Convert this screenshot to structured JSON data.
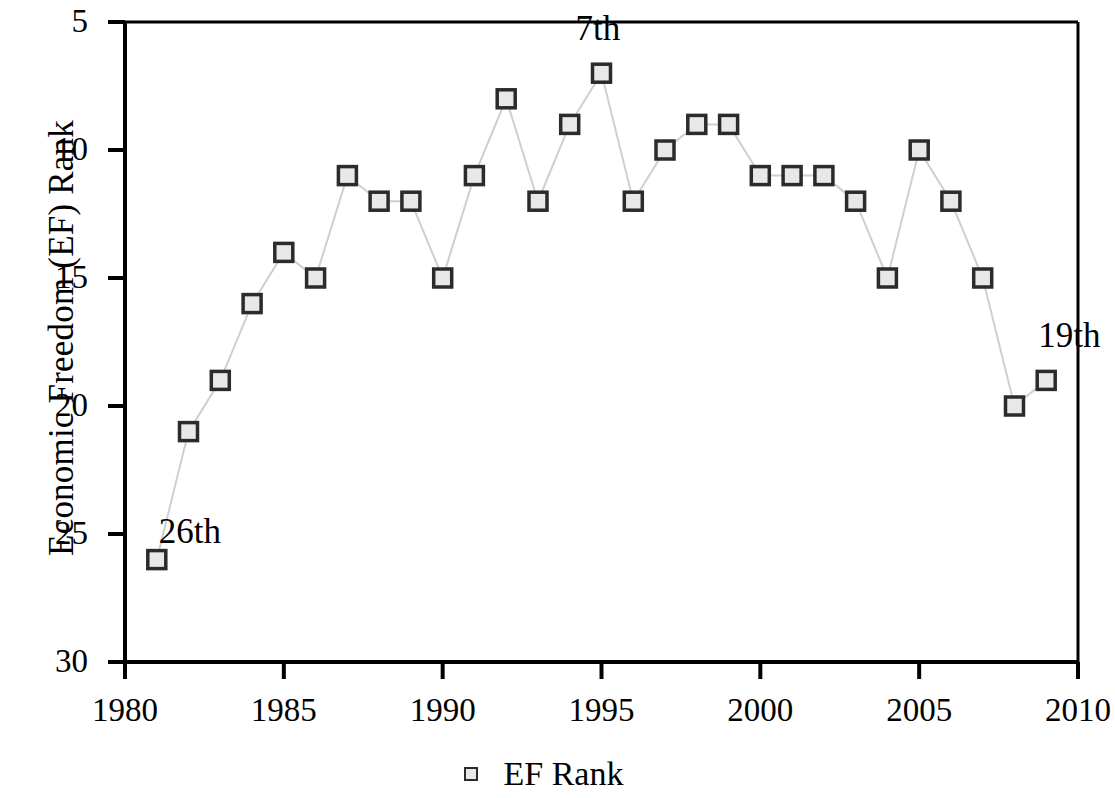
{
  "chart_data": {
    "type": "line",
    "title": "",
    "subtitle": "",
    "xlabel": "",
    "ylabel": "Economic Freedom (EF) Rank",
    "xlim": [
      1980,
      2010
    ],
    "ylim": [
      5,
      30
    ],
    "y_inverted": true,
    "grid": false,
    "legend_position": "bottom-center",
    "xticks": [
      1980,
      1985,
      1990,
      1995,
      2000,
      2005,
      2010
    ],
    "xtick_labels": [
      "1980",
      "1985",
      "1990",
      "1995",
      "2000",
      "2005",
      "2010"
    ],
    "yticks": [
      5,
      10,
      15,
      20,
      25,
      30
    ],
    "ytick_labels": [
      "5",
      "10",
      "15",
      "20",
      "25",
      "30"
    ],
    "series": [
      {
        "name": "EF Rank",
        "marker": "open-square",
        "marker_fill": "#e8e8e8",
        "marker_edge": "#2b2b2b",
        "line_color": "#cfcfcf",
        "x": [
          1981,
          1982,
          1983,
          1984,
          1985,
          1986,
          1987,
          1988,
          1989,
          1990,
          1991,
          1992,
          1993,
          1994,
          1995,
          1996,
          1997,
          1998,
          1999,
          2000,
          2001,
          2002,
          2003,
          2004,
          2005,
          2006,
          2007,
          2008,
          2009
        ],
        "values": [
          26,
          21,
          19,
          16,
          14,
          15,
          11,
          12,
          12,
          15,
          11,
          8,
          12,
          9,
          7,
          12,
          10,
          9,
          9,
          11,
          11,
          11,
          12,
          15,
          10,
          12,
          15,
          20,
          19
        ]
      }
    ],
    "annotations": [
      {
        "text": "26th",
        "x": 1981,
        "y": 25,
        "align": "right-of-point"
      },
      {
        "text": "7th",
        "x": 1995,
        "y": 7,
        "align": "above-point"
      },
      {
        "text": "19th",
        "x": 2009,
        "y": 19,
        "align": "above-left-of-point"
      }
    ]
  },
  "legend": {
    "entries": [
      {
        "label": "EF Rank",
        "marker": "open-square-marker"
      }
    ]
  },
  "axes": {
    "y_axis_title": "Economic Freedom (EF) Rank",
    "x_axis_title": ""
  }
}
